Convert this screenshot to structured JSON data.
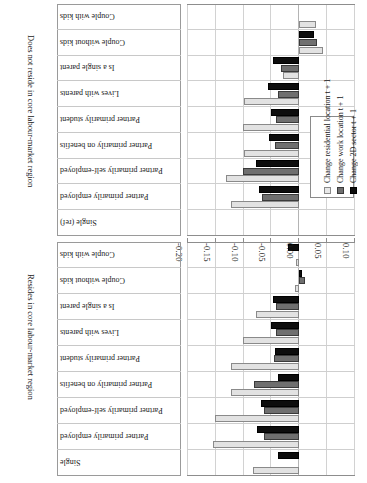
{
  "chart_data": {
    "type": "bar",
    "orientation": "horizontal",
    "title": "",
    "xlabel": "",
    "ylabel": "",
    "xlim": [
      0.1,
      -0.2
    ],
    "xticks": [
      "0.10",
      "0.05",
      "0.00",
      "-0.05",
      "-0.10",
      "-0.15",
      "-0.20"
    ],
    "xtick_values": [
      0.1,
      0.05,
      0.0,
      -0.05,
      -0.1,
      -0.15,
      -0.2
    ],
    "grid": true,
    "legend_position": "inside-left",
    "series": [
      {
        "name": "Change 2D sector t + 1",
        "key": "s0",
        "color": "#0d0d0d"
      },
      {
        "name": "Change work location t + 1",
        "key": "s1",
        "color": "#6f6f6f"
      },
      {
        "name": "Change residential location t + 1",
        "key": "s2",
        "color": "#e2e2e2"
      }
    ],
    "groups": [
      {
        "label": "Does not reside in core labour-market region",
        "categories": [
          "Single (ref)",
          "Partner primarily employed",
          "Partner primarily self-employed",
          "Partner primarily on benefits",
          "Partner primarily student",
          "Lives with parents",
          "Is a single parent",
          "Couple without kids",
          "Couple with kids"
        ],
        "values": {
          "s0": [
            0,
            -0.072,
            -0.077,
            -0.053,
            -0.05,
            -0.055,
            -0.047,
            0.027,
            0.0
          ],
          "s1": [
            0,
            -0.066,
            -0.1,
            -0.043,
            -0.041,
            -0.038,
            -0.033,
            0.032,
            0.0
          ],
          "s2": [
            0,
            -0.123,
            -0.132,
            -0.098,
            -0.1,
            -0.098,
            -0.028,
            0.043,
            0.03
          ]
        }
      },
      {
        "label": "Resides in core labour-market region",
        "categories": [
          "Single",
          "Partner primarily employed",
          "Partner primarily self-employed",
          "Partner primarily on benefits",
          "Partner primarily student",
          "Lives with parents",
          "Is a single parent",
          "Couple without kids",
          "Couple with kids"
        ],
        "values": {
          "s0": [
            -0.038,
            -0.075,
            -0.068,
            -0.038,
            -0.043,
            -0.05,
            -0.047,
            0.005,
            -0.02
          ],
          "s1": [
            0.0,
            -0.063,
            -0.062,
            -0.08,
            -0.045,
            -0.042,
            -0.042,
            0.01,
            0.0
          ],
          "s2": [
            -0.083,
            -0.155,
            -0.15,
            -0.122,
            -0.122,
            -0.1,
            -0.077,
            -0.007,
            -0.006
          ]
        }
      }
    ]
  }
}
